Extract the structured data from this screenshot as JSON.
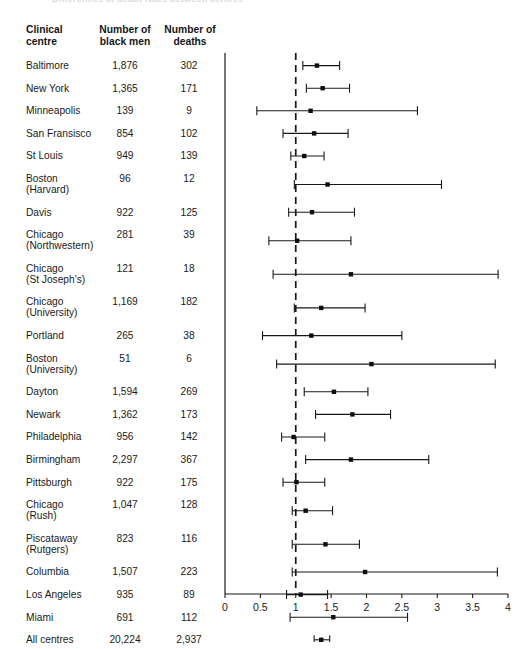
{
  "figure": {
    "cut_title": "Differences in death rates between centres",
    "table": {
      "headers": {
        "centre_line1": "Clinical",
        "centre_line2": "centre",
        "men_line1": "Number of",
        "men_line2": "black men",
        "deaths_line1": "Number of",
        "deaths_line2": "deaths"
      },
      "rows": [
        {
          "name": "Baltimore",
          "name2": "",
          "men": "1,876",
          "deaths": "302"
        },
        {
          "name": "New York",
          "name2": "",
          "men": "1,365",
          "deaths": "171"
        },
        {
          "name": "Minneapolis",
          "name2": "",
          "men": "139",
          "deaths": "9"
        },
        {
          "name": "San Fransisco",
          "name2": "",
          "men": "854",
          "deaths": "102"
        },
        {
          "name": "St Louis",
          "name2": "",
          "men": "949",
          "deaths": "139"
        },
        {
          "name": "Boston",
          "name2": "(Harvard)",
          "men": "96",
          "deaths": "12"
        },
        {
          "name": "Davis",
          "name2": "",
          "men": "922",
          "deaths": "125"
        },
        {
          "name": "Chicago",
          "name2": "(Northwestern)",
          "men": "281",
          "deaths": "39"
        },
        {
          "name": "Chicago",
          "name2": "(St Joseph's)",
          "men": "121",
          "deaths": "18"
        },
        {
          "name": "Chicago",
          "name2": "(University)",
          "men": "1,169",
          "deaths": "182"
        },
        {
          "name": "Portland",
          "name2": "",
          "men": "265",
          "deaths": "38"
        },
        {
          "name": "Boston",
          "name2": "(University)",
          "men": "51",
          "deaths": "6"
        },
        {
          "name": "Dayton",
          "name2": "",
          "men": "1,594",
          "deaths": "269"
        },
        {
          "name": "Newark",
          "name2": "",
          "men": "1,362",
          "deaths": "173"
        },
        {
          "name": "Philadelphia",
          "name2": "",
          "men": "956",
          "deaths": "142"
        },
        {
          "name": "Birmingham",
          "name2": "",
          "men": "2,297",
          "deaths": "367"
        },
        {
          "name": "Pittsburgh",
          "name2": "",
          "men": "922",
          "deaths": "175"
        },
        {
          "name": "Chicago",
          "name2": "(Rush)",
          "men": "1,047",
          "deaths": "128"
        },
        {
          "name": "Piscataway",
          "name2": "(Rutgers)",
          "men": "823",
          "deaths": "116"
        },
        {
          "name": "Columbia",
          "name2": "",
          "men": "1,507",
          "deaths": "223"
        },
        {
          "name": "Los Angeles",
          "name2": "",
          "men": "935",
          "deaths": "89"
        },
        {
          "name": "Miami",
          "name2": "",
          "men": "691",
          "deaths": "112"
        },
        {
          "name": "All centres",
          "name2": "",
          "men": "20,224",
          "deaths": "2,937"
        }
      ]
    }
  },
  "chart_data": {
    "type": "forest",
    "title": "",
    "xlabel": "",
    "ylabel": "",
    "xlim": [
      0,
      4
    ],
    "xticks": [
      0,
      0.5,
      1,
      1.5,
      2,
      2.5,
      3,
      3.5,
      4
    ],
    "xtick_labels": [
      "0",
      "0.5",
      "1",
      "1.5",
      "2",
      "2.5",
      "3",
      "3.5",
      "4"
    ],
    "grid": false,
    "reference_line": 1.0,
    "reference_line_style": "dashed",
    "marker": "filled-square",
    "categories": [
      "Baltimore",
      "New York",
      "Minneapolis",
      "San Fransisco",
      "St Louis",
      "Boston (Harvard)",
      "Davis",
      "Chicago (Northwestern)",
      "Chicago (St Joseph's)",
      "Chicago (University)",
      "Portland",
      "Boston (University)",
      "Dayton",
      "Newark",
      "Philadelphia",
      "Birmingham",
      "Pittsburgh",
      "Chicago (Rush)",
      "Piscataway (Rutgers)",
      "Columbia",
      "Los Angeles",
      "Miami",
      "All centres"
    ],
    "estimates": [
      1.3,
      1.38,
      1.21,
      1.26,
      1.12,
      1.45,
      1.23,
      1.02,
      1.78,
      1.36,
      1.22,
      2.07,
      1.54,
      1.8,
      0.97,
      1.78,
      1.01,
      1.14,
      1.42,
      1.98,
      1.07,
      1.53,
      1.36
    ],
    "ci_low": [
      1.1,
      1.15,
      0.45,
      0.82,
      0.93,
      0.98,
      0.9,
      0.62,
      0.68,
      0.98,
      0.53,
      0.73,
      1.12,
      1.28,
      0.8,
      1.14,
      0.82,
      0.95,
      0.95,
      0.95,
      0.87,
      0.92,
      1.26
    ],
    "ci_high": [
      1.62,
      1.76,
      2.72,
      1.74,
      1.4,
      3.06,
      1.83,
      1.78,
      3.86,
      1.98,
      2.5,
      3.82,
      2.02,
      2.34,
      1.41,
      2.88,
      1.41,
      1.52,
      1.9,
      3.85,
      1.45,
      2.58,
      1.48
    ]
  }
}
